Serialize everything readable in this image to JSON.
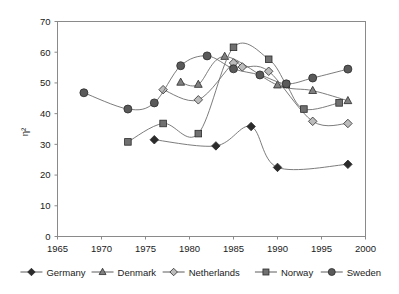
{
  "chart_data": {
    "type": "line",
    "title": "",
    "xlabel": "",
    "ylabel": "η²",
    "xlim": [
      1965,
      2000
    ],
    "ylim": [
      0,
      70
    ],
    "xticks": [
      1965,
      1970,
      1975,
      1980,
      1985,
      1990,
      1995,
      2000
    ],
    "yticks": [
      0,
      10,
      20,
      30,
      40,
      50,
      60,
      70
    ],
    "grid": false,
    "legend_position": "bottom",
    "series": [
      {
        "name": "Germany",
        "marker": "diamond",
        "color": "#2b2b2b",
        "x": [
          1976,
          1983,
          1987,
          1990,
          1998
        ],
        "y": [
          31.5,
          29.5,
          35.8,
          22.5,
          23.5
        ]
      },
      {
        "name": "Denmark",
        "marker": "triangle",
        "color": "#808080",
        "x": [
          1979,
          1981,
          1984,
          1990,
          1994,
          1998
        ],
        "y": [
          50.2,
          49.5,
          58.6,
          49.3,
          47.5,
          44.2
        ]
      },
      {
        "name": "Netherlands",
        "marker": "diamond-open",
        "color": "#bcbcbc",
        "x": [
          1977,
          1981,
          1985,
          1986,
          1989,
          1994,
          1998
        ],
        "y": [
          47.8,
          44.5,
          56.5,
          55.2,
          53.8,
          37.5,
          36.8
        ]
      },
      {
        "name": "Norway",
        "marker": "square",
        "color": "#707070",
        "x": [
          1973,
          1977,
          1981,
          1985,
          1989,
          1991,
          1993,
          1997
        ],
        "y": [
          30.8,
          36.8,
          33.5,
          61.6,
          57.7,
          49.5,
          41.5,
          43.5
        ]
      },
      {
        "name": "Sweden",
        "marker": "circle",
        "color": "#5a5a5a",
        "x": [
          1968,
          1973,
          1976,
          1979,
          1982,
          1985,
          1988,
          1991,
          1994,
          1998
        ],
        "y": [
          46.8,
          41.5,
          43.5,
          55.6,
          58.8,
          54.6,
          52.6,
          49.7,
          51.6,
          54.5
        ]
      }
    ]
  },
  "legend": {
    "items": [
      {
        "label": "Germany"
      },
      {
        "label": "Denmark"
      },
      {
        "label": "Netherlands"
      },
      {
        "label": "Norway"
      },
      {
        "label": "Sweden"
      }
    ]
  }
}
